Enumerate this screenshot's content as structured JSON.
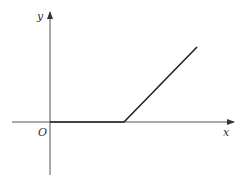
{
  "diagram": {
    "type": "piecewise-linear-function-graph",
    "axes": {
      "x_label": "x",
      "y_label": "y",
      "origin_label": "O"
    },
    "curve": {
      "description": "y = 0 for x <= a, then increasing linearly for x > a",
      "segments": [
        {
          "from": "origin",
          "to": "kink point on x-axis",
          "kind": "horizontal"
        },
        {
          "from": "kink point on x-axis",
          "to": "upper right",
          "kind": "rising line"
        }
      ]
    },
    "colors": {
      "axis": "#555555",
      "curve": "#222222"
    }
  }
}
